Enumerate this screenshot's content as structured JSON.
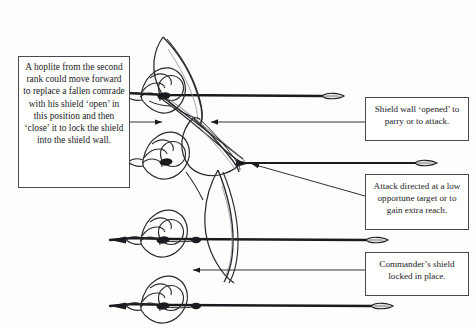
{
  "figure": {
    "background_color": "#fdfdfc",
    "ink_color": "#1b1b1f",
    "line_color": "#4a4a52"
  },
  "callouts": [
    {
      "id": "box-left",
      "name": "callout-second-rank",
      "text": "A hoplite from the second rank could move forward to replace a fallen comrade with his shield ‘open’ in this position and then ‘close’ it to lock the shield into the shield wall."
    },
    {
      "id": "box-right-1",
      "name": "callout-shield-wall-opened",
      "text": "Shield wall ‘opened’ to parry or to attack."
    },
    {
      "id": "box-right-2",
      "name": "callout-attack-directed",
      "text": "Attack directed at a low opportune target or to gain extra reach."
    },
    {
      "id": "box-right-3",
      "name": "callout-commander-shield",
      "text": "Commander’s shield locked in place."
    }
  ],
  "figures": [
    {
      "name": "hoplite-top",
      "role": "hoplite with shield angled open, spear levelled"
    },
    {
      "name": "hoplite-second",
      "role": "hoplite of second rank moving forward"
    },
    {
      "name": "hoplite-third",
      "role": "hoplite with shield locked, spear levelled"
    },
    {
      "name": "hoplite-bottom",
      "role": "commander with shield locked in place"
    }
  ],
  "spears": [
    {
      "name": "spear-1",
      "tip_x": 333,
      "tip_y": 96
    },
    {
      "name": "spear-2",
      "tip_x": 425,
      "tip_y": 163
    },
    {
      "name": "spear-3",
      "tip_x": 376,
      "tip_y": 240
    },
    {
      "name": "spear-4",
      "tip_x": 381,
      "tip_y": 306
    }
  ],
  "leaders": [
    {
      "name": "leader-left-to-figure",
      "from": "box-left",
      "to_x": 165,
      "to_y": 122
    },
    {
      "name": "leader-shieldwall-to-figure",
      "from": "box-right-1",
      "to_x": 208,
      "to_y": 122
    },
    {
      "name": "leader-attack-to-spear",
      "from": "box-right-2",
      "to_x": 248,
      "to_y": 163
    },
    {
      "name": "leader-commander-to-shield",
      "from": "box-right-3",
      "to_x": 190,
      "to_y": 270
    }
  ]
}
